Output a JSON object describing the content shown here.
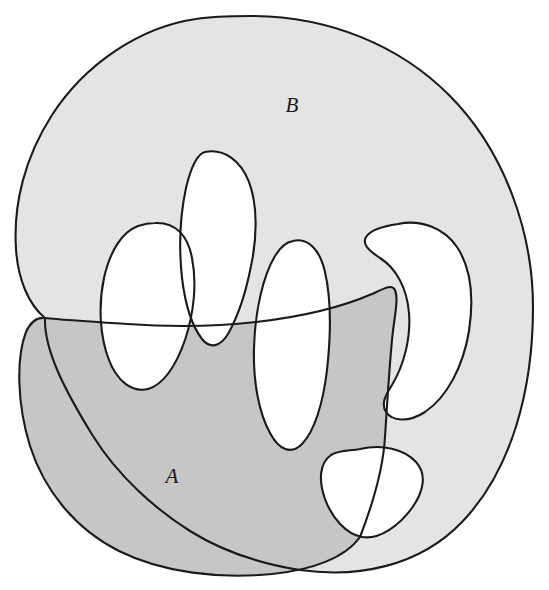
{
  "figure": {
    "background_color": "#ffffff",
    "outline_color": "#1a1a1a",
    "outline_width": 2.1,
    "labels": {
      "region_a": "A",
      "region_b": "B"
    },
    "label_positions": {
      "region_a": {
        "x": 172,
        "y": 483,
        "font_size": 21
      },
      "region_b": {
        "x": 292,
        "y": 112,
        "font_size": 21
      }
    },
    "colors": {
      "region_a_fill": "#c6c6c6",
      "region_b_fill": "#e4e4e4",
      "intersection_fill": "#c6c6c6",
      "hole_fill": "#ffffff",
      "outline": "#1a1a1a",
      "label_color": "#17171a",
      "page_background": "#ffffff"
    },
    "shapes": {
      "region_b_outline": "M 250 16 C 330 16 400 46 449 95 C 505 151 533 233 533 307 C 533 389 512 470 462 522 C 419 567 357 578 300 570 C 262 564 222 551 190 531 C 155 509 118 476 93 436 C 62 386 44 348 45 318 C 29 305 18 280 16 249 C 13 204 25 157 52 115 C 85 64 140 27 196 19 C 214 16 232 16 250 16 Z",
      "region_a_outline": "M 45 318 C 64 320 96 322 127 324 C 169 327 213 327 256 322 C 300 317 342 307 372 294 C 385 288 392 284 395 290 C 399 299 394 318 392 340 C 389 372 387 406 385 437 C 383 472 372 506 360 537 C 345 558 312 570 272 574 C 220 579 163 573 119 551 C 75 529 44 490 30 446 C 17 404 16 358 26 332 C 31 321 37 317 45 318 Z",
      "hole_center_petal": "M 205 152 C 224 148 241 161 249 182 C 258 206 257 238 251 266 C 246 292 237 318 228 334 C 220 347 210 349 202 339 C 192 326 185 303 182 278 C 179 250 180 216 186 188 C 191 167 197 154 205 152 Z",
      "hole_left_petal": "M 155 223 C 176 222 188 236 192 258 C 197 283 194 313 185 340 C 176 366 163 385 148 389 C 132 393 117 381 109 360 C 100 337 98 306 104 278 C 110 251 122 232 138 226 C 144 224 150 223 155 223 Z",
      "hole_right_inner_petal": "M 293 241 C 308 237 320 250 325 272 C 331 298 331 334 327 370 C 323 404 314 432 302 444 C 291 455 279 450 270 433 C 259 413 253 382 254 348 C 255 311 263 276 275 256 C 281 246 287 242 293 241 Z",
      "hole_right_crescent": "M 398 224 C 421 219 444 228 457 247 C 471 268 474 298 469 331 C 463 367 447 397 425 412 C 408 423 392 421 386 412 C 381 404 385 396 392 385 C 404 365 411 338 409 313 C 407 288 396 268 380 258 C 368 250 362 244 366 237 C 371 229 384 226 398 224 Z",
      "hole_bottom_triangle": "M 360 449 C 382 444 404 449 416 462 C 427 474 424 491 412 508 C 399 526 379 540 362 537 C 346 534 332 518 325 499 C 318 479 320 463 331 455 C 339 450 350 451 360 449 Z"
    }
  }
}
